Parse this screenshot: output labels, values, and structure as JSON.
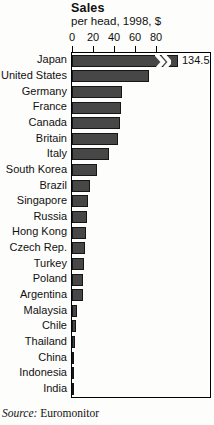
{
  "header": {
    "title": "Sales",
    "subtitle": "per head, 1998, $"
  },
  "source": {
    "prefix": "Source:",
    "text": "Euromonitor"
  },
  "chart_data": {
    "type": "bar",
    "orientation": "horizontal",
    "title": "Sales",
    "subtitle": "per head, 1998, $",
    "xlabel": "per head, 1998, $",
    "axis_position": "top",
    "axis_ticks": [
      0,
      20,
      40,
      60,
      80
    ],
    "xlim": [
      0,
      132
    ],
    "grid": false,
    "legend": "none",
    "categories": [
      "Japan",
      "United States",
      "Germany",
      "France",
      "Canada",
      "Britain",
      "Italy",
      "South Korea",
      "Brazil",
      "Singapore",
      "Russia",
      "Hong Kong",
      "Czech Rep.",
      "Turkey",
      "Poland",
      "Argentina",
      "Malaysia",
      "Chile",
      "Thailand",
      "China",
      "Indonesia",
      "India"
    ],
    "values": [
      134.5,
      73,
      48,
      47,
      46,
      44,
      35,
      24,
      17,
      15,
      14,
      13,
      12,
      11,
      10.5,
      10,
      5,
      4,
      2.5,
      1.5,
      1.2,
      1
    ],
    "annotations": [
      {
        "category": "Japan",
        "label": "134.5",
        "note": "bar truncated with axis-break symbol"
      }
    ],
    "colors": {
      "bar_fill": "#474747",
      "bar_border": "#161616",
      "axis": "#000000",
      "background": "#fdfdfb"
    }
  }
}
